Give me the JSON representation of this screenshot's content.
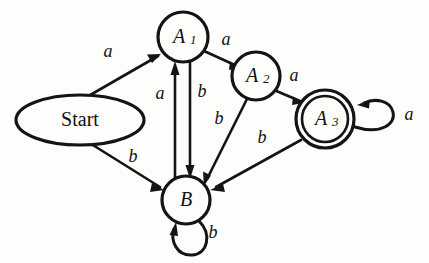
{
  "diagram": {
    "kind": "finite-state-machine",
    "canvas": {
      "width": 429,
      "height": 263
    },
    "colors": {
      "background": "#fdfdfb",
      "stroke": "#141414",
      "label": "#111111"
    },
    "nodes": [
      {
        "id": "start",
        "label": "Start",
        "base": "Start",
        "subscript": "",
        "shape": "ellipse",
        "accepting": false,
        "cx": 80,
        "cy": 120,
        "rx": 64,
        "ry": 25
      },
      {
        "id": "A1",
        "label": "A1",
        "base": "A",
        "subscript": "1",
        "shape": "circle",
        "accepting": false,
        "cx": 183,
        "cy": 37,
        "r": 25
      },
      {
        "id": "A2",
        "label": "A2",
        "base": "A",
        "subscript": "2",
        "shape": "circle",
        "accepting": false,
        "cx": 256,
        "cy": 76,
        "r": 24
      },
      {
        "id": "A3",
        "label": "A3",
        "base": "A",
        "subscript": "3",
        "shape": "double-circle",
        "accepting": true,
        "cx": 325,
        "cy": 119,
        "r": 29,
        "r_inner": 23
      },
      {
        "id": "B",
        "label": "B",
        "base": "B",
        "subscript": "",
        "shape": "circle",
        "accepting": false,
        "cx": 186,
        "cy": 200,
        "r": 24
      }
    ],
    "edges": [
      {
        "id": "start-a1",
        "from": "start",
        "to": "A1",
        "label": "a",
        "label_x": 108,
        "label_y": 53,
        "kind": "straight"
      },
      {
        "id": "start-b",
        "from": "start",
        "to": "B",
        "label": "b",
        "label_x": 133,
        "label_y": 158,
        "kind": "straight"
      },
      {
        "id": "a1-a2",
        "from": "A1",
        "to": "A2",
        "label": "a",
        "label_x": 226,
        "label_y": 41,
        "kind": "straight"
      },
      {
        "id": "a2-a3",
        "from": "A2",
        "to": "A3",
        "label": "a",
        "label_x": 294,
        "label_y": 77,
        "kind": "straight"
      },
      {
        "id": "a1-b",
        "from": "A1",
        "to": "B",
        "label": "b",
        "label_x": 202,
        "label_y": 93,
        "kind": "vertical-right"
      },
      {
        "id": "b-a1",
        "from": "B",
        "to": "A1",
        "label": "a",
        "label_x": 160,
        "label_y": 95,
        "kind": "vertical-left"
      },
      {
        "id": "a2-b",
        "from": "A2",
        "to": "B",
        "label": "b",
        "label_x": 219,
        "label_y": 120,
        "kind": "straight"
      },
      {
        "id": "a3-b",
        "from": "A3",
        "to": "B",
        "label": "b",
        "label_x": 262,
        "label_y": 139,
        "kind": "straight"
      },
      {
        "id": "a3-a3",
        "from": "A3",
        "to": "A3",
        "label": "a",
        "label_x": 409,
        "label_y": 116,
        "kind": "self-loop-right"
      },
      {
        "id": "b-b",
        "from": "B",
        "to": "B",
        "label": "b",
        "label_x": 213,
        "label_y": 234,
        "kind": "self-loop-bottom"
      }
    ],
    "transition_table": {
      "symbols": [
        "a",
        "b"
      ],
      "rows": [
        {
          "state": "Start",
          "a": "A1",
          "b": "B"
        },
        {
          "state": "A1",
          "a": "A2",
          "b": "B"
        },
        {
          "state": "A2",
          "a": "A3",
          "b": "B"
        },
        {
          "state": "A3",
          "a": "A3",
          "b": "B"
        },
        {
          "state": "B",
          "a": "A1",
          "b": "B"
        }
      ]
    }
  }
}
